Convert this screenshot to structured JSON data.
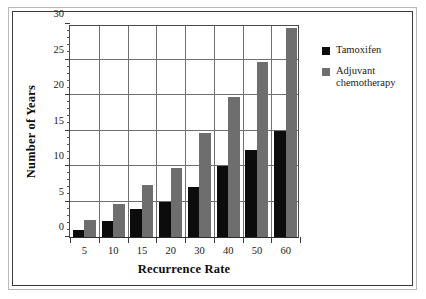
{
  "chart_data": {
    "type": "bar",
    "title": "",
    "xlabel": "Recurrence Rate",
    "ylabel": "Number of Years",
    "categories": [
      "5",
      "10",
      "15",
      "20",
      "30",
      "40",
      "50",
      "60"
    ],
    "series": [
      {
        "name": "Tamoxifen",
        "color": "#0c0c0c",
        "values": [
          1,
          2.2,
          3.9,
          5,
          7,
          10,
          12.2,
          15
        ]
      },
      {
        "name": "Adjuvant chemotherapy",
        "color": "#6e6e6e",
        "values": [
          2.4,
          4.7,
          7.3,
          9.7,
          14.6,
          19.7,
          24.6,
          29.5
        ]
      }
    ],
    "ylim": [
      0,
      30
    ],
    "yticks": [
      0,
      5,
      10,
      15,
      20,
      25,
      30
    ],
    "yticklabels": [
      "0",
      "5",
      "10",
      "15",
      "20",
      "25",
      "30"
    ],
    "yminor_step": 1,
    "grid": "horizontal-and-vertical",
    "legend_position": "right",
    "legend_entries": [
      {
        "label": "Tamoxifen",
        "color": "#0c0c0c"
      },
      {
        "label": "Adjuvant chemotherapy",
        "color": "#6e6e6e"
      }
    ]
  },
  "legend": {
    "entries": [
      {
        "line1": "Tamoxifen",
        "line2": ""
      },
      {
        "line1": "Adjuvant",
        "line2": "chemotherapy"
      }
    ]
  },
  "colors": {
    "series_tamoxifen": "#0c0c0c",
    "series_adjuvant": "#6e6e6e",
    "axis": "#3a3a3a",
    "grid": "#707070",
    "frame_outer": "#b9b9b9",
    "frame_inner": "#3a3a3a",
    "background": "#ffffff"
  }
}
